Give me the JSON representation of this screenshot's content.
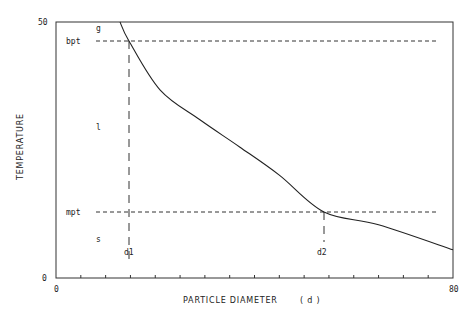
{
  "chart_data": {
    "type": "line",
    "title": "",
    "xlabel": "PARTICLE DIAMETER",
    "xlabel_symbol": "( d )",
    "ylabel": "TEMPERATURE",
    "xlim": [
      0,
      80
    ],
    "ylim": [
      0,
      50
    ],
    "x_tick_labels": [
      "0",
      "80"
    ],
    "y_tick_labels": [
      "0",
      "50"
    ],
    "x_minor_tick_step": 5,
    "grid": false,
    "legend": null,
    "series": [
      {
        "name": "phase boundary curve",
        "x": [
          12.9,
          14.7,
          21.0,
          29.0,
          37.0,
          45.0,
          54.0,
          65.0,
          80.0
        ],
        "y": [
          50.0,
          46.3,
          36.7,
          30.9,
          25.6,
          20.1,
          12.9,
          10.4,
          5.5
        ]
      }
    ],
    "reference_lines": [
      {
        "label": "bpt",
        "orientation": "horizontal",
        "y": 46.3,
        "style": "dashed"
      },
      {
        "label": "mpt",
        "orientation": "horizontal",
        "y": 12.9,
        "style": "dashed"
      },
      {
        "label": "d1",
        "orientation": "vertical",
        "x": 14.7,
        "style": "dashed"
      },
      {
        "label": "d2",
        "orientation": "vertical",
        "x": 54.0,
        "style": "dashed"
      }
    ],
    "region_labels": [
      {
        "text": "g",
        "meaning": "gas"
      },
      {
        "text": "l",
        "meaning": "liquid"
      },
      {
        "text": "s",
        "meaning": "solid"
      }
    ]
  },
  "labels": {
    "y_top": "50",
    "y_bottom": "0",
    "x_left": "0",
    "x_right": "80",
    "bpt": "bpt",
    "mpt": "mpt",
    "d1": "d1",
    "d2": "d2",
    "g": "g",
    "l": "l",
    "s": "s",
    "xlabel": "PARTICLE DIAMETER",
    "xlabel_symbol": "( d )",
    "ylabel": "TEMPERATURE"
  }
}
